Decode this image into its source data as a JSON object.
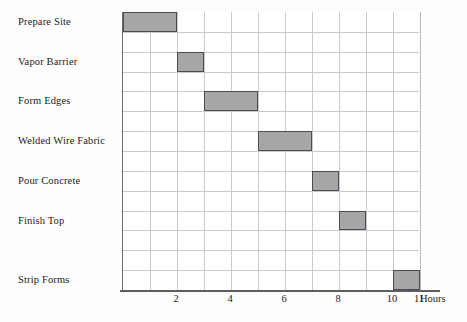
{
  "chart_data": {
    "type": "bar",
    "orientation": "horizontal",
    "variant": "gantt",
    "title": "",
    "xlabel": "Hours",
    "ylabel": "",
    "xlim": [
      0,
      11
    ],
    "ylim": [
      0,
      14
    ],
    "grid": true,
    "legend": null,
    "x_ticks": [
      2,
      4,
      6,
      8,
      10,
      11
    ],
    "x_tick_labels": [
      "2",
      "4",
      "6",
      "8",
      "10",
      "11"
    ],
    "categories": [
      "Prepare Site",
      "Vapor Barrier",
      "Form Edges",
      "Welded Wire Fabric",
      "Pour Concrete",
      "Finish Top",
      "Strip Forms"
    ],
    "tasks": [
      {
        "name": "Prepare Site",
        "start": 0,
        "end": 2,
        "duration": 2,
        "row": 0
      },
      {
        "name": "Vapor Barrier",
        "start": 2,
        "end": 3,
        "duration": 1,
        "row": 2
      },
      {
        "name": "Form Edges",
        "start": 3,
        "end": 5,
        "duration": 2,
        "row": 4
      },
      {
        "name": "Welded Wire Fabric",
        "start": 5,
        "end": 7,
        "duration": 2,
        "row": 6
      },
      {
        "name": "Pour Concrete",
        "start": 7,
        "end": 8,
        "duration": 1,
        "row": 8
      },
      {
        "name": "Finish Top",
        "start": 8,
        "end": 9,
        "duration": 1,
        "row": 10
      },
      {
        "name": "Strip Forms",
        "start": 10,
        "end": 11,
        "duration": 1,
        "row": 13
      }
    ],
    "rows_total": 14,
    "bar_fill_color": "#a6a6a6",
    "bar_border_color": "#4b4b52",
    "grid_color": "#c9c9cf",
    "axis_color": "#5d5d63",
    "text_color": "#1c1c20"
  },
  "labels": {
    "prepare_site": "Prepare Site",
    "vapor_barrier": "Vapor Barrier",
    "form_edges": "Form Edges",
    "welded_wire_fabric": "Welded Wire Fabric",
    "pour_concrete": "Pour Concrete",
    "finish_top": "Finish Top",
    "strip_forms": "Strip Forms"
  },
  "axis": {
    "x_title": "Hours",
    "t2": "2",
    "t4": "4",
    "t6": "6",
    "t8": "8",
    "t10": "10",
    "t11": "11"
  }
}
